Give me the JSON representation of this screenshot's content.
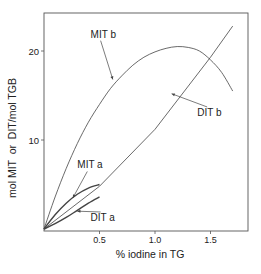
{
  "chart_data": {
    "type": "line",
    "title": "",
    "xlabel": "% iodine in TG",
    "ylabel": "mol MIT  or  DIT/mol TGB",
    "xlim": [
      0,
      1.85
    ],
    "ylim": [
      0,
      24.5
    ],
    "xticks": [
      0.5,
      1.0,
      1.5
    ],
    "xtick_labels": [
      "0.5",
      "1.0",
      "1.5"
    ],
    "yticks": [
      10,
      20
    ],
    "ytick_labels": [
      "10",
      "20"
    ],
    "grid": false,
    "legend": "none (curves labeled directly)",
    "series": [
      {
        "name": "MIT b",
        "x": [
          0,
          0.1,
          0.2,
          0.3,
          0.4,
          0.5,
          0.6,
          0.7,
          0.8,
          0.9,
          1.0,
          1.1,
          1.2,
          1.3,
          1.4,
          1.5,
          1.6,
          1.7
        ],
        "y": [
          0,
          3.6,
          6.8,
          9.6,
          12.0,
          14.0,
          15.8,
          17.2,
          18.4,
          19.3,
          19.9,
          20.3,
          20.5,
          20.4,
          20.0,
          19.0,
          17.6,
          15.5
        ]
      },
      {
        "name": "DIT b",
        "x": [
          0,
          0.5,
          1.0,
          1.5,
          1.7
        ],
        "y": [
          0,
          4.8,
          11.2,
          19.3,
          22.8
        ]
      },
      {
        "name": "MIT a",
        "x": [
          0,
          0.1,
          0.2,
          0.3,
          0.4,
          0.5
        ],
        "y": [
          0,
          1.6,
          2.9,
          3.9,
          4.6,
          5.0
        ]
      },
      {
        "name": "DIT a",
        "x": [
          0,
          0.1,
          0.2,
          0.3,
          0.4,
          0.5
        ],
        "y": [
          0,
          0.6,
          1.3,
          2.1,
          2.9,
          3.6
        ]
      }
    ],
    "annotations": [
      {
        "text": "MIT b",
        "x": 0.42,
        "y": 21.5,
        "arrow_to": [
          0.62,
          16.8
        ]
      },
      {
        "text": "DIT b",
        "x": 1.38,
        "y": 12.7,
        "arrow_to": [
          1.15,
          15.2
        ]
      },
      {
        "text": "MIT a",
        "x": 0.3,
        "y": 6.8,
        "arrow_to": [
          0.26,
          3.5
        ]
      },
      {
        "text": "DIT a",
        "x": 0.42,
        "y": 0.9,
        "arrow_to": [
          0.3,
          2.0
        ]
      }
    ]
  }
}
